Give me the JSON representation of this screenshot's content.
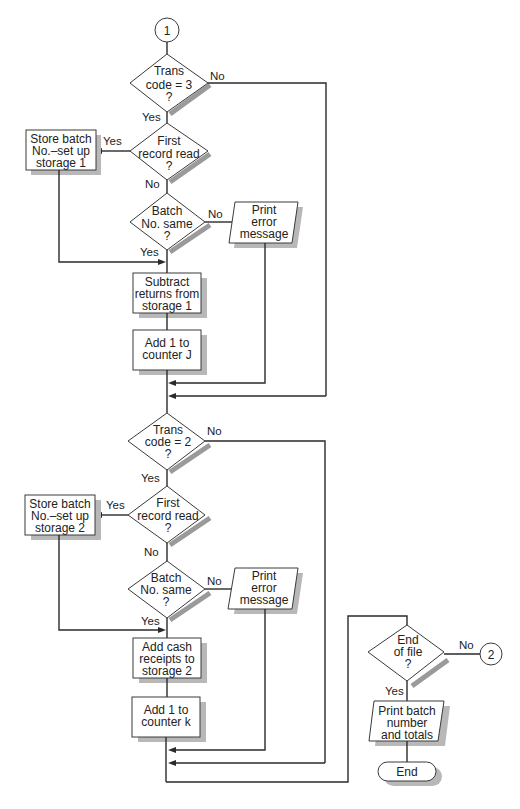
{
  "diagram": {
    "connectors": {
      "start": "1",
      "end": "2"
    },
    "section1": {
      "trans_code": [
        "Trans",
        "code = 3",
        "?"
      ],
      "first_record": [
        "First",
        "record read",
        "?"
      ],
      "store_batch": [
        "Store batch",
        "No.–set up",
        "storage 1"
      ],
      "batch_same": [
        "Batch",
        "No. same",
        "?"
      ],
      "print_error": [
        "Print",
        "error",
        "message"
      ],
      "subtract": [
        "Subtract",
        "returns from",
        "storage 1"
      ],
      "add_counter": [
        "Add 1 to",
        "counter J"
      ]
    },
    "section2": {
      "trans_code": [
        "Trans",
        "code = 2",
        "?"
      ],
      "first_record": [
        "First",
        "record read",
        "?"
      ],
      "store_batch": [
        "Store batch",
        "No.–set up",
        "storage 2"
      ],
      "batch_same": [
        "Batch",
        "No. same",
        "?"
      ],
      "print_error": [
        "Print",
        "error",
        "message"
      ],
      "add_cash": [
        "Add cash",
        "receipts to",
        "storage 2"
      ],
      "add_counter": [
        "Add 1 to",
        "counter k"
      ]
    },
    "section3": {
      "end_of_file": [
        "End",
        "of file",
        "?"
      ],
      "print_totals": [
        "Print batch",
        "number",
        "and totals"
      ],
      "end": "End"
    },
    "labels": {
      "yes": "Yes",
      "no": "No"
    }
  }
}
